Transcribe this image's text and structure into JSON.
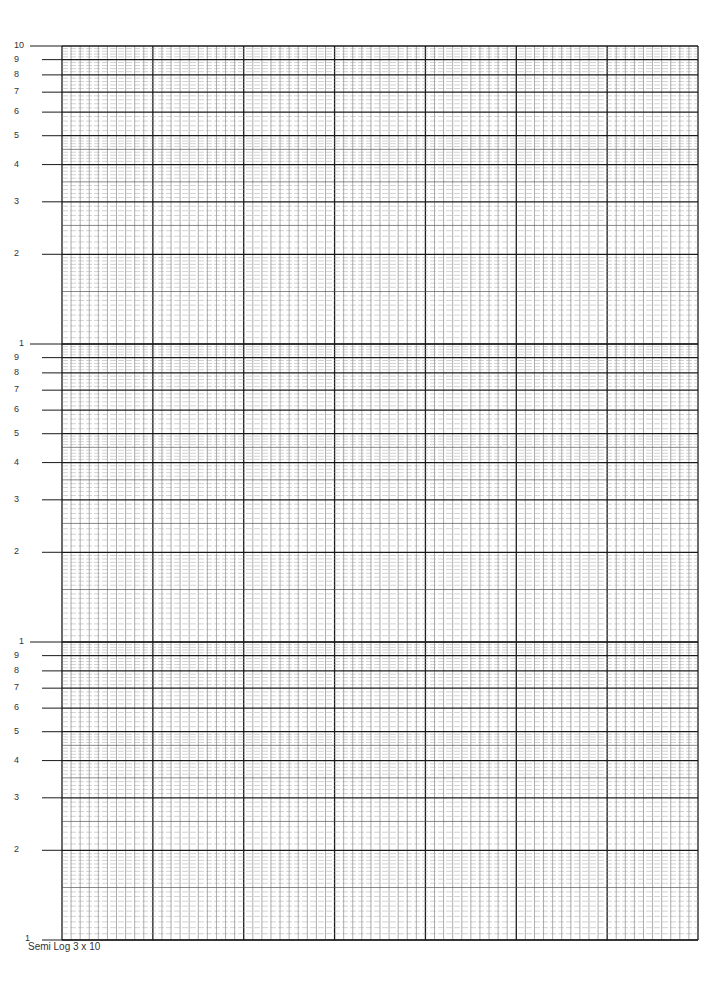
{
  "document": {
    "caption": "Semi Log 3 x 10",
    "type": "semi-log graph paper"
  },
  "grid": {
    "left": 62,
    "right": 698,
    "top": 46,
    "bottom": 940,
    "cycles": 3,
    "major_columns": 7,
    "minor_per_major_column": 10,
    "line_color": "#1a1a1a",
    "minor_color": "#777777"
  },
  "y_axis": {
    "cycles": [
      {
        "labels": [
          "10",
          "9",
          "8",
          "7",
          "6",
          "5",
          "4",
          "3",
          "2"
        ]
      },
      {
        "labels": [
          "1",
          "9",
          "8",
          "7",
          "6",
          "5",
          "4",
          "3",
          "2"
        ]
      },
      {
        "labels": [
          "1",
          "9",
          "8",
          "7",
          "6",
          "5",
          "4",
          "3",
          "2"
        ]
      }
    ],
    "bottom_label": "1"
  }
}
